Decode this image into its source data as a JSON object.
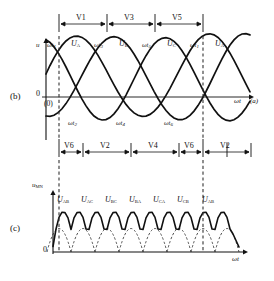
{
  "figure": {
    "panels": [
      {
        "tag": "(b)",
        "sub_tag": "(a)"
      },
      {
        "tag": "(c)"
      }
    ]
  },
  "panel_b": {
    "tag": "(b)",
    "y_axis_label": "u",
    "x_axis_label": "ωt",
    "right_note": "(a)",
    "origin_label": "0",
    "origin_paren": "(0)",
    "top_switch_bands": [
      {
        "label": "V1",
        "x_start": 59,
        "x_end": 107
      },
      {
        "label": "V3",
        "x_start": 107,
        "x_end": 155
      },
      {
        "label": "V5",
        "x_start": 155,
        "x_end": 203
      }
    ],
    "bottom_switch_bands": [
      {
        "label": "V6",
        "x_start": 59,
        "x_end": 83
      },
      {
        "label": "V2",
        "x_start": 83,
        "x_end": 131
      },
      {
        "label": "V4",
        "x_start": 131,
        "x_end": 179
      },
      {
        "label": "V6",
        "x_start": 179,
        "x_end": 203
      },
      {
        "label": "V2",
        "x_start": 203,
        "x_end": 251
      }
    ],
    "peak_labels": [
      {
        "text": "U",
        "sub": "A",
        "x": 78,
        "y": 44
      },
      {
        "text": "U",
        "sub": "B",
        "x": 126,
        "y": 44
      },
      {
        "text": "U",
        "sub": "C",
        "x": 174,
        "y": 44
      },
      {
        "text": "U",
        "sub": "A",
        "x": 222,
        "y": 44
      }
    ],
    "crossing_labels_top": [
      {
        "text": "ωt",
        "sub": "1",
        "x": 48,
        "y": 46
      },
      {
        "text": "ωt",
        "sub": "3",
        "x": 96,
        "y": 46
      },
      {
        "text": "ωt",
        "sub": "5",
        "x": 144,
        "y": 46
      },
      {
        "text": "ωt",
        "sub": "1",
        "x": 192,
        "y": 46
      }
    ],
    "crossing_labels_bottom": [
      {
        "text": "ωt",
        "sub": "2",
        "x": 72,
        "y": 123
      },
      {
        "text": "ωt",
        "sub": "4",
        "x": 120,
        "y": 123
      },
      {
        "text": "ωt",
        "sub": "6",
        "x": 168,
        "y": 123
      }
    ],
    "dashed_markers_x": [
      59,
      203
    ],
    "waves": {
      "type": "three-phase-sine",
      "phases": [
        {
          "name": "U_A",
          "phase_deg": 0
        },
        {
          "name": "U_B",
          "phase_deg": -120
        },
        {
          "name": "U_C",
          "phase_deg": -240
        }
      ],
      "amplitude": 38,
      "period_px": 144,
      "baseline_y": 97
    }
  },
  "panel_c": {
    "tag": "(c)",
    "y_axis_label": "u",
    "y_axis_sub": "MN",
    "x_axis_label": "ωt",
    "origin_label": "0",
    "line_voltage_labels": [
      {
        "text": "U",
        "sub": "AB",
        "x": 62,
        "y": 200
      },
      {
        "text": "U",
        "sub": "AC",
        "x": 86,
        "y": 200
      },
      {
        "text": "U",
        "sub": "BC",
        "x": 110,
        "y": 200
      },
      {
        "text": "U",
        "sub": "BA",
        "x": 134,
        "y": 200
      },
      {
        "text": "U",
        "sub": "CA",
        "x": 158,
        "y": 200
      },
      {
        "text": "U",
        "sub": "CB",
        "x": 182,
        "y": 200
      },
      {
        "text": "U",
        "sub": "AB",
        "x": 206,
        "y": 200
      }
    ],
    "dashed_markers_x": [
      59,
      203
    ],
    "waves": {
      "type": "six-pulse-rectified",
      "amplitude": 34,
      "segment_px": 24,
      "baseline_y": 252
    }
  },
  "colors": {
    "ink": "#111111",
    "dashed": "#333333",
    "background": "#ffffff"
  }
}
